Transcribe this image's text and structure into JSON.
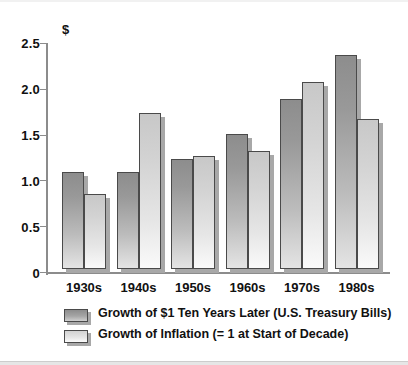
{
  "chart_data": {
    "type": "bar",
    "title": "",
    "subtitle": "",
    "xlabel": "",
    "ylabel": "$",
    "ylim": [
      0,
      2.5
    ],
    "ytick_values": [
      0,
      0.5,
      1.0,
      1.5,
      2.0,
      2.5
    ],
    "ytick_labels": [
      "0",
      "0.5",
      "1.0",
      "1.5",
      "2.0",
      "2.5"
    ],
    "grid": false,
    "legend_position": "bottom-left",
    "categories": [
      "1930s",
      "1940s",
      "1950s",
      "1960s",
      "1970s",
      "1980s"
    ],
    "series": [
      {
        "name": "Growth of $1 Ten Years Later (U.S. Treasury Bills)",
        "color": "#999999",
        "values": [
          1.05,
          1.05,
          1.18,
          1.45,
          1.83,
          2.31
        ]
      },
      {
        "name": "Growth of Inflation (= 1 at Start of Decade)",
        "color": "#e2e2e2",
        "values": [
          0.81,
          1.68,
          1.22,
          1.27,
          2.02,
          1.62
        ]
      }
    ]
  },
  "axis": {
    "y_title": "$",
    "y_labels": [
      "2.5",
      "2.0",
      "1.5",
      "1.0",
      "0.5",
      "0"
    ],
    "x_labels": [
      "1930s",
      "1940s",
      "1950s",
      "1960s",
      "1970s",
      "1980s"
    ]
  },
  "legend": {
    "items": [
      {
        "label": "Growth of $1 Ten Years Later (U.S. Treasury Bills)",
        "swatch": "series-a"
      },
      {
        "label": "Growth of Inflation (= 1 at Start of Decade)",
        "swatch": "series-b"
      }
    ]
  }
}
